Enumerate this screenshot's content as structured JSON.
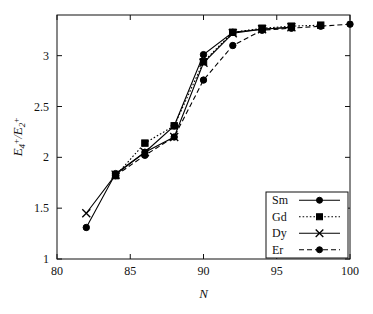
{
  "chart_data": {
    "type": "line",
    "title": "",
    "xlabel": "N",
    "ylabel": "E4+/E2+",
    "ylabel_parts": {
      "base1": "E",
      "sub1": "4",
      "sup1": "+",
      "slash": "/",
      "base2": "E",
      "sub2": "2",
      "sup2": "+"
    },
    "xlim": [
      80,
      100
    ],
    "ylim": [
      1,
      3.4
    ],
    "xticks": [
      80,
      85,
      90,
      95,
      100
    ],
    "xticklabels": [
      "80",
      "85",
      "90",
      "95",
      "100"
    ],
    "yticks": [
      1,
      1.5,
      2,
      2.5,
      3
    ],
    "yticklabels": [
      "1",
      "1.5",
      "2",
      "2.5",
      "3"
    ],
    "grid": false,
    "legend_position": "lower right",
    "series": [
      {
        "name": "Sm",
        "marker": "filled-circle",
        "linestyle": "solid",
        "x": [
          82,
          84,
          86,
          88,
          90,
          92,
          94,
          96
        ],
        "values": [
          1.31,
          1.84,
          2.05,
          2.31,
          3.01,
          3.23,
          3.26,
          3.28
        ]
      },
      {
        "name": "Gd",
        "marker": "filled-square",
        "linestyle": "dotted",
        "x": [
          84,
          86,
          88,
          90,
          92,
          94,
          96,
          98
        ],
        "values": [
          1.82,
          2.14,
          2.31,
          2.94,
          3.23,
          3.27,
          3.29,
          3.3
        ]
      },
      {
        "name": "Dy",
        "marker": "x",
        "linestyle": "solid",
        "x": [
          82,
          84,
          86,
          88,
          90,
          92,
          94,
          96
        ],
        "values": [
          1.45,
          1.83,
          2.05,
          2.2,
          2.93,
          3.22,
          3.26,
          3.28
        ]
      },
      {
        "name": "Er",
        "marker": "filled-circle",
        "linestyle": "dashed",
        "x": [
          84,
          86,
          88,
          90,
          92,
          94,
          96,
          98,
          100
        ],
        "values": [
          1.82,
          2.02,
          2.2,
          2.76,
          3.1,
          3.25,
          3.27,
          3.29,
          3.31
        ]
      }
    ]
  },
  "legend": {
    "entries": [
      {
        "label": "Sm"
      },
      {
        "label": "Gd"
      },
      {
        "label": "Dy"
      },
      {
        "label": "Er"
      }
    ]
  }
}
